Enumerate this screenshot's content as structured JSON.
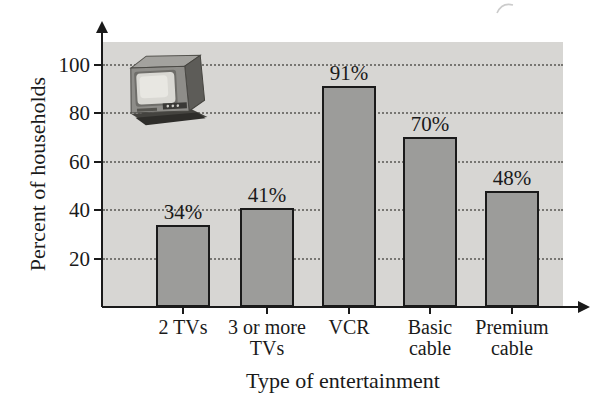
{
  "chart_data": {
    "type": "bar",
    "categories": [
      "2 TVs",
      "3 or more TVs",
      "VCR",
      "Basic cable",
      "Premium cable"
    ],
    "category_lines": [
      [
        "2 TVs"
      ],
      [
        "3 or more",
        "TVs"
      ],
      [
        "VCR"
      ],
      [
        "Basic",
        "cable"
      ],
      [
        "Premium",
        "cable"
      ]
    ],
    "values": [
      34,
      41,
      91,
      70,
      48
    ],
    "value_labels": [
      "34%",
      "41%",
      "91%",
      "70%",
      "48%"
    ],
    "title": "",
    "xlabel": "Type of entertainment",
    "ylabel": "Percent of households",
    "ylim": [
      0,
      110
    ],
    "yticks": [
      20,
      40,
      60,
      80,
      100
    ],
    "grid": true,
    "gridline_style": "dotted",
    "legend": "none",
    "icon": "tv-icon",
    "colors": {
      "plot_background": "#d7d6d3",
      "bar_fill": "#9c9c9a",
      "bar_border": "#1a1a1a",
      "axis": "#1a1a1a",
      "gridline": "#777672",
      "text": "#1a1a1a"
    }
  }
}
